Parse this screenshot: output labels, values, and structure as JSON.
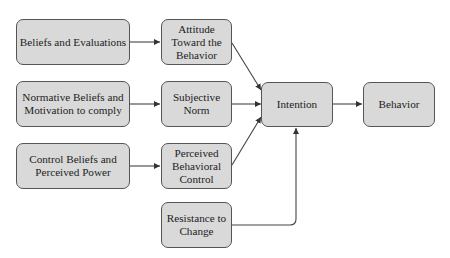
{
  "diagram": {
    "type": "flowchart",
    "nodes": [
      {
        "id": "beliefs",
        "label": "Beliefs and Evaluations"
      },
      {
        "id": "normative",
        "label": "Normative Beliefs and\nMotivation to comply"
      },
      {
        "id": "control",
        "label": "Control Beliefs and\nPerceived Power"
      },
      {
        "id": "attitude",
        "label": "Attitude\nToward the\nBehavior"
      },
      {
        "id": "subjective",
        "label": "Subjective\nNorm"
      },
      {
        "id": "perceived",
        "label": "Perceived\nBehavioral\nControl"
      },
      {
        "id": "resistance",
        "label": "Resistance to\nChange"
      },
      {
        "id": "intention",
        "label": "Intention"
      },
      {
        "id": "behavior",
        "label": "Behavior"
      }
    ],
    "edges": [
      {
        "from": "beliefs",
        "to": "attitude"
      },
      {
        "from": "normative",
        "to": "subjective"
      },
      {
        "from": "control",
        "to": "perceived"
      },
      {
        "from": "attitude",
        "to": "intention"
      },
      {
        "from": "subjective",
        "to": "intention"
      },
      {
        "from": "perceived",
        "to": "intention"
      },
      {
        "from": "resistance",
        "to": "intention"
      },
      {
        "from": "intention",
        "to": "behavior"
      }
    ],
    "colors": {
      "node_fill": "#d9d9d9",
      "node_border": "#555555",
      "edge": "#444444",
      "text": "#222222"
    }
  }
}
